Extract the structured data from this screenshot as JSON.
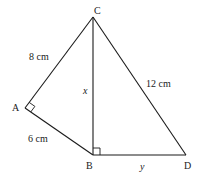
{
  "diagram": {
    "type": "geometry",
    "background": "#ffffff",
    "line_color": "#1a1a1a",
    "points": {
      "C": {
        "label": "C",
        "x": 93,
        "y": 17
      },
      "A": {
        "label": "A",
        "x": 25,
        "y": 108
      },
      "B": {
        "label": "B",
        "x": 93,
        "y": 155
      },
      "D": {
        "label": "D",
        "x": 186,
        "y": 155
      }
    },
    "segments": [
      {
        "from": "A",
        "to": "C",
        "label": "8 cm"
      },
      {
        "from": "A",
        "to": "B",
        "label": "6 cm"
      },
      {
        "from": "C",
        "to": "B",
        "label": "x"
      },
      {
        "from": "C",
        "to": "D",
        "label": "12 cm"
      },
      {
        "from": "B",
        "to": "D",
        "label": "y"
      }
    ],
    "right_angles": [
      "A",
      "B"
    ],
    "labels": {
      "C": "C",
      "A": "A",
      "B": "B",
      "D": "D",
      "AC": "8 cm",
      "AB": "6 cm",
      "CB": "x",
      "CD": "12 cm",
      "BD": "y"
    }
  }
}
